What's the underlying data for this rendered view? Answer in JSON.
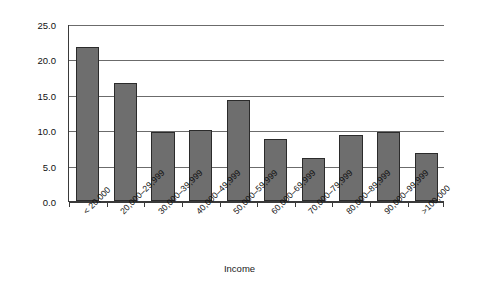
{
  "chart_data": {
    "type": "bar",
    "title": "",
    "xlabel": "Income",
    "ylabel": "Percentage",
    "categories": [
      "< 20,000",
      "20,000–29,999",
      "30,000–39,999",
      "40,000–49,999",
      "50,000–59,999",
      "60,000–69,999",
      "70,000–79,999",
      "80,000–89,999",
      "90,000–99,999",
      ">100,000"
    ],
    "values": [
      21.7,
      16.7,
      9.7,
      10.1,
      14.3,
      8.8,
      6.1,
      9.3,
      9.8,
      6.8
    ],
    "ylim": [
      0.0,
      25.0
    ],
    "ytick_labels": [
      "0.0",
      "5.0",
      "10.0",
      "15.0",
      "20.0",
      "25.0"
    ],
    "ytick_values": [
      0.0,
      5.0,
      10.0,
      15.0,
      20.0,
      25.0
    ],
    "grid": "horizontal",
    "legend": "none",
    "bar_color": "#6e6e6e",
    "bar_edge_color": "#2b2b2b",
    "grid_color": "#6b6b6b",
    "axis_color": "#3a3a3a",
    "background": "#ffffff"
  }
}
